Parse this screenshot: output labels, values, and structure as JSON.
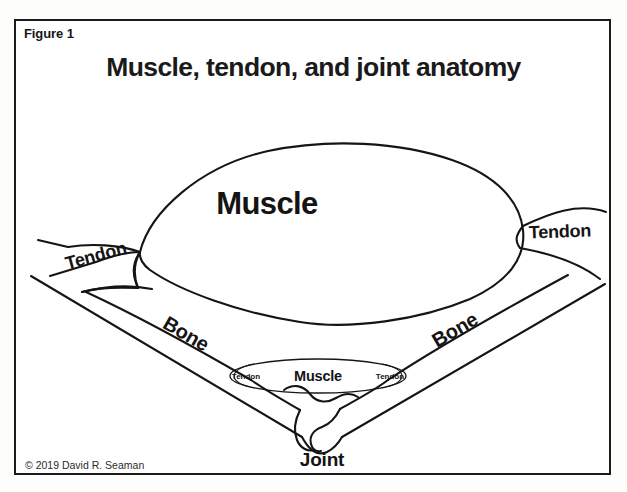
{
  "figure": {
    "label": "Figure 1",
    "title": "Muscle, tendon, and joint anatomy",
    "copyright": "© 2019 David R. Seaman",
    "border_color": "#1b1b1b",
    "ink_color": "#141414",
    "background_color": "#ffffff"
  },
  "labels": {
    "muscle_main": "Muscle",
    "tendon_left": "Tendon",
    "tendon_right": "Tendon",
    "bone_left": "Bone",
    "bone_right": "Bone",
    "muscle_inner": "Muscle",
    "tendon_inner_left": "Tendon",
    "tendon_inner_right": "Tendon",
    "joint": "Joint"
  },
  "structures": [
    {
      "name": "muscle-belly",
      "kind": "muscle",
      "label": "Muscle"
    },
    {
      "name": "tendon-left",
      "kind": "tendon",
      "label": "Tendon"
    },
    {
      "name": "tendon-right",
      "kind": "tendon",
      "label": "Tendon"
    },
    {
      "name": "bone-left",
      "kind": "bone",
      "label": "Bone"
    },
    {
      "name": "bone-right",
      "kind": "bone",
      "label": "Bone"
    },
    {
      "name": "muscle-inner",
      "kind": "muscle",
      "label": "Muscle"
    },
    {
      "name": "tendon-inner-left",
      "kind": "tendon",
      "label": "Tendon"
    },
    {
      "name": "tendon-inner-right",
      "kind": "tendon",
      "label": "Tendon"
    },
    {
      "name": "joint",
      "kind": "joint",
      "label": "Joint"
    }
  ]
}
